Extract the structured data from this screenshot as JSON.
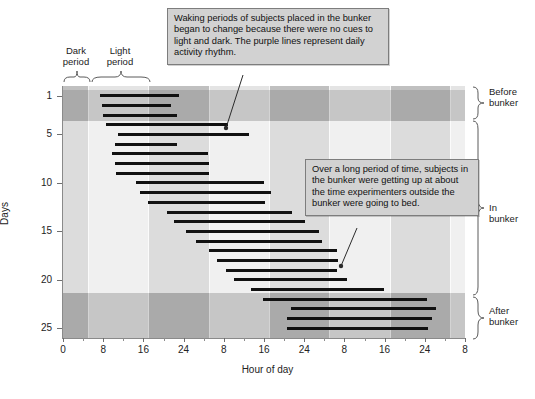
{
  "chart_data": {
    "type": "bar",
    "title": "",
    "subtitle": "",
    "xlabel": "Hour of day",
    "ylabel": "Days",
    "xlim": [
      0,
      80
    ],
    "ylim": [
      0.0,
      26.0
    ],
    "grid": false,
    "legend_position": "none",
    "orientation": "horizontal-span-per-day",
    "x_ticks": [
      {
        "value": 0,
        "label": "0"
      },
      {
        "value": 8,
        "label": "8"
      },
      {
        "value": 16,
        "label": "16"
      },
      {
        "value": 24,
        "label": "24"
      },
      {
        "value": 32,
        "label": "8"
      },
      {
        "value": 40,
        "label": "16"
      },
      {
        "value": 48,
        "label": "24"
      },
      {
        "value": 56,
        "label": "8"
      },
      {
        "value": 64,
        "label": "16"
      },
      {
        "value": 72,
        "label": "24"
      },
      {
        "value": 80,
        "label": "8"
      }
    ],
    "x_minor_ticks": [
      4,
      12,
      20,
      28,
      36,
      44,
      52,
      60,
      68,
      76
    ],
    "y_ticks": [
      {
        "value": 1,
        "label": "1"
      },
      {
        "value": 5,
        "label": "5"
      },
      {
        "value": 10,
        "label": "10"
      },
      {
        "value": 15,
        "label": "15"
      },
      {
        "value": 20,
        "label": "20"
      },
      {
        "value": 25,
        "label": "25"
      }
    ],
    "vertical_bands": [
      {
        "start": 0,
        "end": 5,
        "kind": "dark"
      },
      {
        "start": 5,
        "end": 17,
        "kind": "light"
      },
      {
        "start": 17,
        "end": 29,
        "kind": "dark"
      },
      {
        "start": 29,
        "end": 41,
        "kind": "light"
      },
      {
        "start": 41,
        "end": 53,
        "kind": "dark"
      },
      {
        "start": 53,
        "end": 65,
        "kind": "light"
      },
      {
        "start": 65,
        "end": 77,
        "kind": "dark"
      },
      {
        "start": 77,
        "end": 80,
        "kind": "light"
      }
    ],
    "horizontal_bands": [
      {
        "start_day": 0.4,
        "end_day": 3.6,
        "phase": "before-bunker",
        "shade": "dark"
      },
      {
        "start_day": 3.6,
        "end_day": 21.4,
        "phase": "in-bunker",
        "shade": "light"
      },
      {
        "start_day": 21.4,
        "end_day": 26.0,
        "phase": "after-bunker",
        "shade": "dark"
      }
    ],
    "bars": [
      {
        "day": 1,
        "start_hour": 7.4,
        "end_hour": 23.1
      },
      {
        "day": 2,
        "start_hour": 7.7,
        "end_hour": 21.4
      },
      {
        "day": 3,
        "start_hour": 8.0,
        "end_hour": 22.7
      },
      {
        "day": 4,
        "start_hour": 8.6,
        "end_hour": 32.9
      },
      {
        "day": 5,
        "start_hour": 11.0,
        "end_hour": 37.0
      },
      {
        "day": 6,
        "start_hour": 10.4,
        "end_hour": 22.7
      },
      {
        "day": 7,
        "start_hour": 9.8,
        "end_hour": 28.9
      },
      {
        "day": 8,
        "start_hour": 10.4,
        "end_hour": 29.1
      },
      {
        "day": 9,
        "start_hour": 10.6,
        "end_hour": 29.1
      },
      {
        "day": 10,
        "start_hour": 14.5,
        "end_hour": 40.0
      },
      {
        "day": 11,
        "start_hour": 15.3,
        "end_hour": 41.4
      },
      {
        "day": 12,
        "start_hour": 17.0,
        "end_hour": 40.2
      },
      {
        "day": 13,
        "start_hour": 20.6,
        "end_hour": 45.6
      },
      {
        "day": 14,
        "start_hour": 22.1,
        "end_hour": 48.1
      },
      {
        "day": 15,
        "start_hour": 24.5,
        "end_hour": 51.0
      },
      {
        "day": 16,
        "start_hour": 26.4,
        "end_hour": 51.6
      },
      {
        "day": 17,
        "start_hour": 29.0,
        "end_hour": 54.6
      },
      {
        "day": 18,
        "start_hour": 30.6,
        "end_hour": 54.8
      },
      {
        "day": 19,
        "start_hour": 32.5,
        "end_hour": 54.6
      },
      {
        "day": 20,
        "start_hour": 34.0,
        "end_hour": 56.6
      },
      {
        "day": 21,
        "start_hour": 37.5,
        "end_hour": 63.8
      },
      {
        "day": 22,
        "start_hour": 39.8,
        "end_hour": 72.5
      },
      {
        "day": 23,
        "start_hour": 45.4,
        "end_hour": 74.2
      },
      {
        "day": 24,
        "start_hour": 44.6,
        "end_hour": 73.5
      },
      {
        "day": 25,
        "start_hour": 44.6,
        "end_hour": 72.6
      }
    ]
  },
  "axes": {
    "y_title": "Days",
    "x_title": "Hour of day"
  },
  "period_labels": {
    "dark": "Dark\nperiod",
    "dark_line1": "Dark",
    "dark_line2": "period",
    "light_line1": "Light",
    "light_line2": "period"
  },
  "phase_labels": {
    "before_line1": "Before",
    "before_line2": "bunker",
    "in_line1": "In",
    "in_line2": "bunker",
    "after_line1": "After",
    "after_line2": "bunker"
  },
  "callouts": {
    "waking": "Waking periods of subjects placed in the bunker began to change because there were no cues to light and dark. The purple lines represent daily activity rhythm.",
    "long_period": "Over a long period of time, subjects in the bunker were getting up at about the time experimenters outside the bunker were going to bed."
  },
  "colors": {
    "band_dark": "#c0c0c0",
    "band_light": "#e4e4e4",
    "row_dark_overlay": "#b4b4b4",
    "plot_bg": "#efefef",
    "bar": "#111111",
    "callout_bg": "#d2d2d2",
    "callout_border": "#7d7d7d",
    "axis": "#8a8a8a",
    "text": "#1b1b1b"
  }
}
